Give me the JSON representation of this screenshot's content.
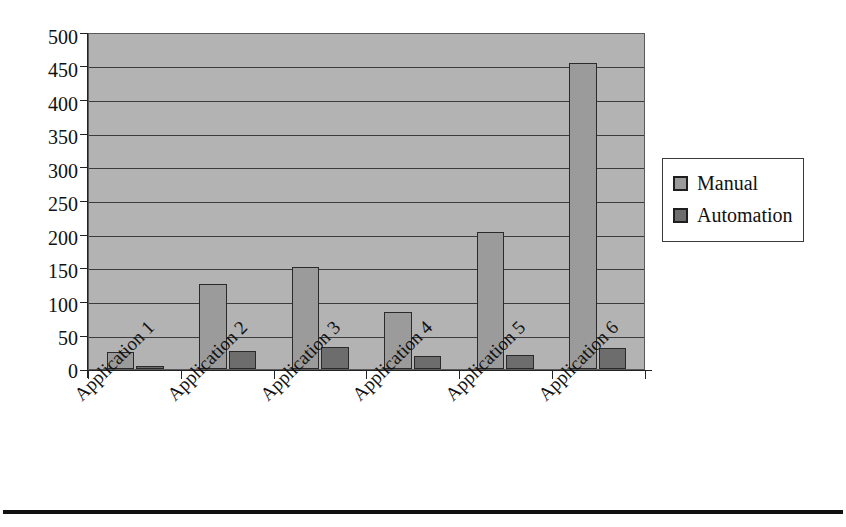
{
  "chart_data": {
    "type": "bar",
    "title": "",
    "subtitle": "",
    "xlabel": "",
    "ylabel": "",
    "categories": [
      "Application 1",
      "Application 2",
      "Application 3",
      "Application 4",
      "Application 5",
      "Application 6"
    ],
    "series": [
      {
        "name": "Manual",
        "color": "#9b9b9b",
        "values": [
          25,
          127,
          153,
          85,
          205,
          456
        ]
      },
      {
        "name": "Automation",
        "color": "#6d6d6d",
        "values": [
          4,
          27,
          33,
          20,
          21,
          31
        ]
      }
    ],
    "ylim": [
      0,
      500
    ],
    "ytick_labels": [
      "500",
      "450",
      "400",
      "350",
      "300",
      "250",
      "200",
      "150",
      "100",
      "50",
      "0"
    ],
    "ytick_values": [
      500,
      450,
      400,
      350,
      300,
      250,
      200,
      150,
      100,
      50,
      0
    ],
    "ytick_step": 50,
    "grid": true,
    "grid_axis": "y",
    "legend_position": "right",
    "plot_background": "#b3b3b3",
    "figure_background": "#ffffff",
    "xtick_label_rotation": -45
  },
  "legend": {
    "items": [
      {
        "label": "Manual",
        "swatch": "manual"
      },
      {
        "label": "Automation",
        "swatch": "automation"
      }
    ]
  }
}
